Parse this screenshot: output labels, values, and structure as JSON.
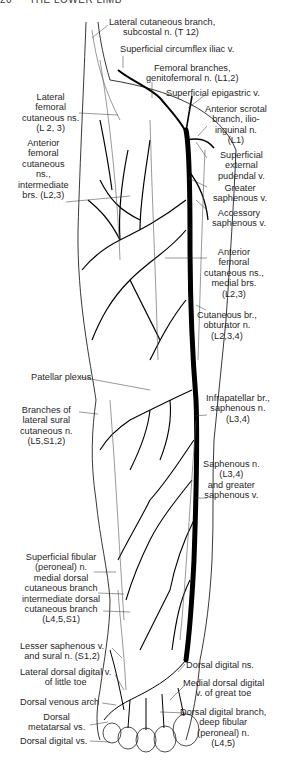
{
  "header": {
    "page_number": "20",
    "title": "THE LOWER LIMB"
  },
  "figure": {
    "colors": {
      "ink": "#111111",
      "vein": "#000000",
      "nerve": "#555555",
      "background": "#ffffff"
    }
  },
  "labels": {
    "lat_cut_branch": [
      "Lateral cutaneous branch,",
      "subcostal n. (T 12)"
    ],
    "sup_circ_iliac": [
      "Superficial circumflex iliac v."
    ],
    "femoral_branches": [
      "Femoral branches,",
      "genitofemoral n. (L1,2)"
    ],
    "sup_epigastric": [
      "Superficial epigastric v."
    ],
    "ant_scrotal": [
      "Anterior scrotal",
      "branch, ilio-",
      "inguinal n.",
      "(L1)"
    ],
    "sup_ext_pudendal": [
      "Superficial",
      "external",
      "pudendal v."
    ],
    "greater_saphenous": [
      "Greater",
      "saphenous v."
    ],
    "accessory_saphenous": [
      "Accessory",
      "saphenous v."
    ],
    "ant_fem_medial": [
      "Anterior",
      "femoral",
      "cutaneous ns.,",
      "medial brs.",
      "(L2,3)"
    ],
    "cut_br_obturator": [
      "Cutaneous br.,",
      "obturator n.",
      "(L2,3,4)"
    ],
    "lat_fem_cut": [
      "Lateral",
      "femoral",
      "cutaneous ns.",
      "(L 2, 3)"
    ],
    "ant_fem_intermediate": [
      "Anterior",
      "femoral",
      "cutaneous",
      "ns.,",
      "intermediate",
      "brs. (L2,3)"
    ],
    "patellar_plexus": [
      "Patellar plexus"
    ],
    "infrapatellar": [
      "Infrapatellar br.,",
      "saphenous n.",
      "(L3,4)"
    ],
    "branches_lat_sural": [
      "Branches of",
      "lateral sural",
      "cutaneous n.",
      "(L5,S1,2)"
    ],
    "saphenous_n": [
      "Saphenous n.",
      "(L3,4)",
      "and greater",
      "saphenous v."
    ],
    "sup_fibular": [
      "Superficial fibular",
      "(peroneal) n.",
      "medial dorsal",
      "cutaneous branch",
      "intermediate dorsal",
      "cutaneous branch",
      "(L4,5,S1)"
    ],
    "lesser_saphenous": [
      "Lesser saphenous v.",
      "and sural n. (S1,2)"
    ],
    "lat_dorsal_digital": [
      "Lateral dorsal digital v.",
      "of little toe"
    ],
    "dorsal_venous_arch": [
      "Dorsal venous arch"
    ],
    "dorsal_metatarsal": [
      "Dorsal",
      "metatarsal vs."
    ],
    "dorsal_digital_vs": [
      "Dorsal digital vs."
    ],
    "dorsal_digital_ns": [
      "Dorsal digital ns."
    ],
    "medial_dorsal_digital": [
      "Medial dorsal digital",
      "v. of great toe"
    ],
    "dorsal_digital_branch": [
      "Dorsal digital branch,",
      "deep fibular",
      "(peroneal) n.",
      "(L4,5)"
    ]
  }
}
